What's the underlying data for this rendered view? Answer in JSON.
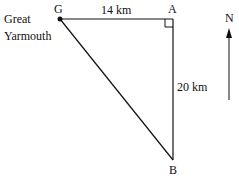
{
  "diagram": {
    "place_label_line1": "Great",
    "place_label_line2": "Yarmouth",
    "points": {
      "G": "G",
      "A": "A",
      "B": "B"
    },
    "distances": {
      "GA": "14 km",
      "AB": "20 km"
    },
    "north_label": "N",
    "colors": {
      "line": "#111111",
      "background": "#ffffff"
    }
  }
}
